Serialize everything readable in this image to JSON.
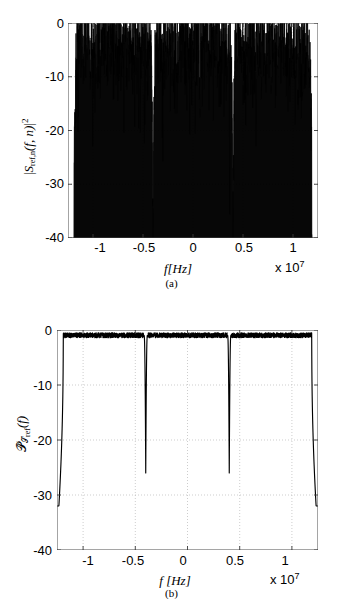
{
  "figure": {
    "panels": [
      {
        "id": "a",
        "caption": "(a)",
        "ylabel_prefix": "|S",
        "ylabel_sub": "ref,n",
        "ylabel_args": "(f, n)|",
        "ylabel_sup": "2",
        "xlabel": "f[Hz]",
        "exponent_text": "x 10",
        "exponent_sup": "7",
        "yticks": [
          "0",
          "-10",
          "-20",
          "-30",
          "-40"
        ],
        "xticks": [
          "-1",
          "-0.5",
          "0",
          "0.5",
          "1"
        ]
      },
      {
        "id": "b",
        "caption": "(b)",
        "ylabel_script": "P",
        "ylabel_sub": "S",
        "ylabel_sub2": "ref",
        "ylabel_args": "(f)",
        "xlabel": "f [Hz]",
        "exponent_text": "x 10",
        "exponent_sup": "7",
        "yticks": [
          "0",
          "-10",
          "-20",
          "-30",
          "-40"
        ],
        "xticks": [
          "-1",
          "-0.5",
          "0",
          "0.5",
          "1"
        ]
      }
    ]
  },
  "chart_data": [
    {
      "type": "line",
      "panel": "a",
      "title": "",
      "xlabel": "f[Hz]",
      "ylabel": "|S_ref,n(f,n)|^2",
      "xlim": [
        -12500000,
        12500000
      ],
      "ylim": [
        -40,
        0
      ],
      "x_multiplier": "x 10^7",
      "xticks": [
        -10000000,
        -5000000,
        0,
        5000000,
        10000000
      ],
      "xticklabels": [
        "-1",
        "-0.5",
        "0",
        "0.5",
        "1"
      ],
      "yticks": [
        0,
        -10,
        -20,
        -30,
        -40
      ],
      "yticklabels": [
        "0",
        "-10",
        "-20",
        "-30",
        "-40"
      ],
      "grid": true,
      "grid_style": "dotted",
      "legend": null,
      "description": "Dense noisy periodogram of a single realization; spectral magnitude fluctuates rapidly between about 0 dB and below -40 dB, filling the band as a solid black mass whose upper envelope sits near -2 dB.",
      "signal_bands": [
        {
          "from": -11800000,
          "to": -4200000,
          "upper_envelope_db": -2,
          "typical_floor_db": -30
        },
        {
          "from": -3800000,
          "to": 3800000,
          "upper_envelope_db": -2,
          "typical_floor_db": -30
        },
        {
          "from": 4200000,
          "to": 11800000,
          "upper_envelope_db": -2,
          "typical_floor_db": -30
        }
      ],
      "notch_frequencies": [
        -4000000,
        4000000
      ],
      "notch_depth_db": -40,
      "band_edges": [
        -11900000,
        11900000
      ],
      "band_edge_rolloff_db": -40,
      "noise_upper_envelope_db": -2,
      "noise_lower_envelope_db": -40
    },
    {
      "type": "line",
      "panel": "b",
      "title": "",
      "xlabel": "f [Hz]",
      "ylabel": "P_hat_S_ref(f)",
      "xlim": [
        -12500000,
        12500000
      ],
      "ylim": [
        -40,
        0
      ],
      "x_multiplier": "x 10^7",
      "xticks": [
        -10000000,
        -5000000,
        0,
        5000000,
        10000000
      ],
      "xticklabels": [
        "-1",
        "-0.5",
        "0",
        "0.5",
        "1"
      ],
      "yticks": [
        0,
        -10,
        -20,
        -30,
        -40
      ],
      "yticklabels": [
        "0",
        "-10",
        "-20",
        "-30",
        "-40"
      ],
      "grid": true,
      "grid_style": "dotted",
      "legend": null,
      "description": "Smooth averaged power spectral density estimate; flat passband near -1 dB with two deep narrow notches and steep roll-off at the band edges.",
      "passband_level_db": -1,
      "notches": [
        {
          "frequency": -4000000,
          "depth_db": -26
        },
        {
          "frequency": 4000000,
          "depth_db": -26
        }
      ],
      "band_edges": [
        {
          "frequency": -11900000,
          "floor_db": -32
        },
        {
          "frequency": 11900000,
          "floor_db": -32
        }
      ],
      "passband_ripple_db": 0.5
    }
  ]
}
